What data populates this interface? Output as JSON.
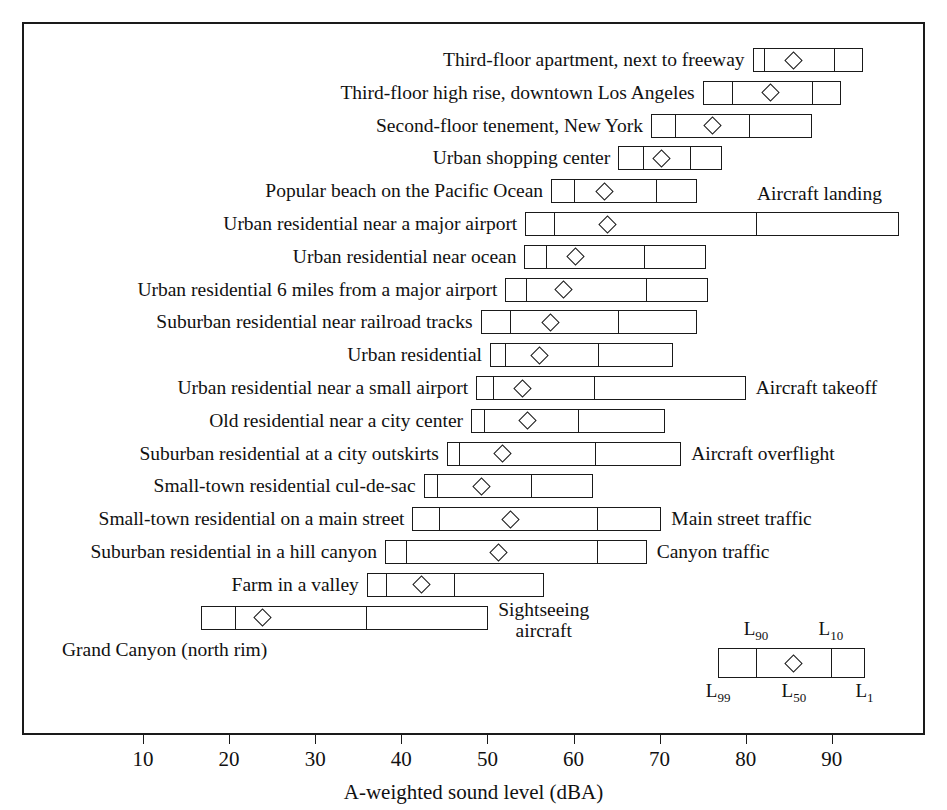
{
  "chart_data": {
    "type": "box",
    "title": "",
    "xlabel": "A-weighted sound level (dBA)",
    "ylabel": "",
    "xlim": [
      12,
      100
    ],
    "xticks": [
      10,
      20,
      30,
      40,
      50,
      60,
      70,
      80,
      90
    ],
    "xticklabels": [
      "10",
      "20",
      "30",
      "40",
      "50",
      "60",
      "70",
      "80",
      "90"
    ],
    "grid": false,
    "legend_position": "inside-bottom-right",
    "box_percentiles": [
      "L99",
      "L90",
      "L50",
      "L10",
      "L1"
    ],
    "legend": {
      "L99": "L99",
      "L90": "L90",
      "L50": "L50",
      "L10": "L10",
      "L1": "L1",
      "box": {
        "l99": 76.8,
        "l90": 81.2,
        "l50": 85.6,
        "l10": 89.9,
        "l1": 93.8
      }
    },
    "rows": [
      {
        "label": "Third-floor apartment, next to freeway",
        "note": "",
        "l99": 80.8,
        "l90": 82.1,
        "l50": 85.5,
        "l10": 90.2,
        "l1": 93.6
      },
      {
        "label": "Third-floor high rise, downtown Los Angeles",
        "note": "",
        "l99": 75.0,
        "l90": 78.4,
        "l50": 82.9,
        "l10": 87.7,
        "l1": 91.1
      },
      {
        "label": "Second-floor tenement, New York",
        "note": "",
        "l99": 69.0,
        "l90": 71.8,
        "l50": 76.1,
        "l10": 80.4,
        "l1": 87.7
      },
      {
        "label": "Urban shopping center",
        "note": "",
        "l99": 65.2,
        "l90": 68.1,
        "l50": 70.2,
        "l10": 73.5,
        "l1": 77.2
      },
      {
        "label": "Popular beach on the Pacific Ocean",
        "note": "",
        "l99": 57.4,
        "l90": 60.1,
        "l50": 63.6,
        "l10": 69.6,
        "l1": 74.3
      },
      {
        "label": "Urban residential near a major airport",
        "note": "Aircraft landing",
        "l99": 54.4,
        "l90": 57.7,
        "l50": 64.0,
        "l10": 81.2,
        "l1": 97.8
      },
      {
        "label": "Urban residential near ocean",
        "note": "",
        "l99": 54.3,
        "l90": 56.8,
        "l50": 60.2,
        "l10": 68.2,
        "l1": 75.4
      },
      {
        "label": "Urban residential 6 miles from a major airport",
        "note": "",
        "l99": 52.1,
        "l90": 54.5,
        "l50": 58.8,
        "l10": 68.4,
        "l1": 75.6
      },
      {
        "label": "Suburban residential near railroad tracks",
        "note": "",
        "l99": 49.2,
        "l90": 52.6,
        "l50": 57.3,
        "l10": 65.2,
        "l1": 74.3
      },
      {
        "label": "Urban residential",
        "note": "",
        "l99": 50.3,
        "l90": 52.1,
        "l50": 56.0,
        "l10": 62.9,
        "l1": 71.5
      },
      {
        "label": "Urban residential near a small airport",
        "note": "Aircraft takeoff",
        "l99": 48.7,
        "l90": 50.7,
        "l50": 54.1,
        "l10": 62.4,
        "l1": 80.0
      },
      {
        "label": "Old residential near a city center",
        "note": "",
        "l99": 48.1,
        "l90": 49.6,
        "l50": 54.7,
        "l10": 60.5,
        "l1": 70.6
      },
      {
        "label": "Suburban residential at a city outskirts",
        "note": "Aircraft overflight",
        "l99": 45.3,
        "l90": 46.7,
        "l50": 51.8,
        "l10": 62.5,
        "l1": 72.5
      },
      {
        "label": "Small-town residential cul-de-sac",
        "note": "",
        "l99": 42.6,
        "l90": 44.2,
        "l50": 49.3,
        "l10": 55.1,
        "l1": 62.3
      },
      {
        "label": "Small-town residential on a main street",
        "note": "Main street traffic",
        "l99": 41.3,
        "l90": 44.4,
        "l50": 52.7,
        "l10": 62.7,
        "l1": 70.2
      },
      {
        "label": "Suburban residential in a hill canyon",
        "note": "Canyon traffic",
        "l99": 38.1,
        "l90": 40.6,
        "l50": 51.3,
        "l10": 62.7,
        "l1": 68.5
      },
      {
        "label": "Farm in a valley",
        "note": "",
        "l99": 36.0,
        "l90": 38.2,
        "l50": 42.3,
        "l10": 46.1,
        "l1": 56.6
      },
      {
        "label": "Grand Canyon (north rim)",
        "note": "Sightseeing\naircraft",
        "l99": 16.7,
        "l90": 20.7,
        "l50": 23.9,
        "l10": 35.9,
        "l1": 50.1
      }
    ]
  }
}
